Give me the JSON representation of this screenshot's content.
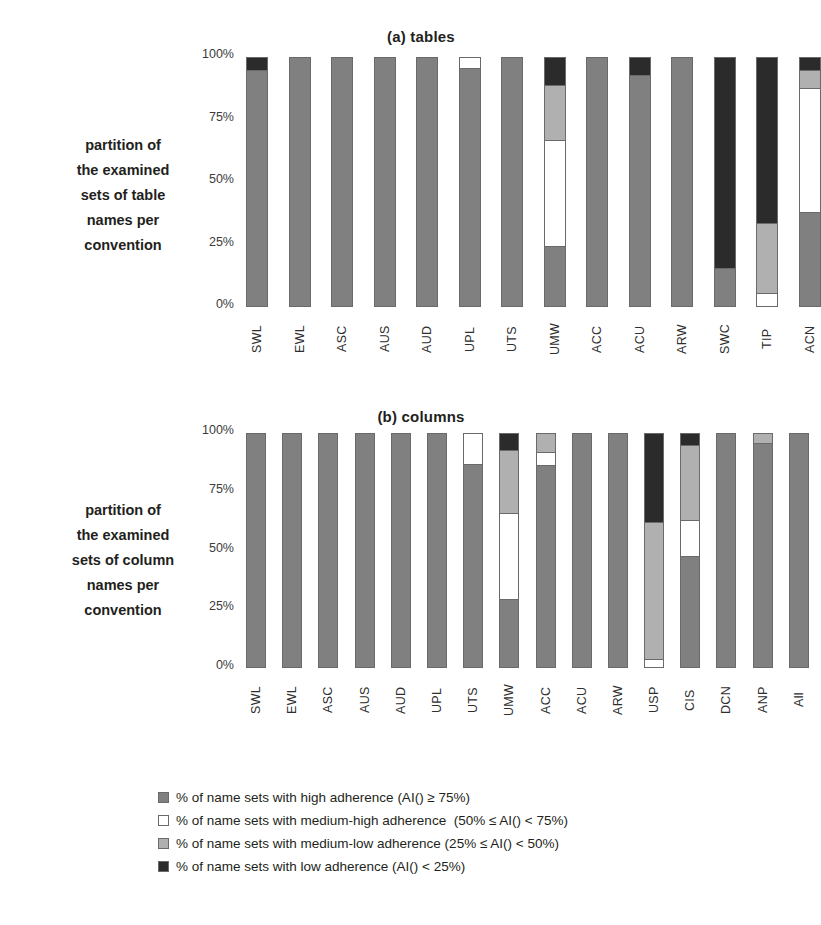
{
  "colors": {
    "high": "#808080",
    "medium_high": "#ffffff",
    "medium_low": "#b0b0b0",
    "low": "#2b2b2b",
    "outline": "#6a6a6a",
    "text": "#231f20"
  },
  "panels": [
    {
      "title": "(a) tables",
      "axis_caption": "partition of\nthe examined\nsets of  table\nnames per\nconvention"
    },
    {
      "title": "(b) columns",
      "axis_caption": "partition of\nthe examined\nsets of  column\nnames per\nconvention"
    }
  ],
  "legend": {
    "items": [
      {
        "swatch": "high",
        "label": "% of name sets with high adherence (AI() ≥ 75%)"
      },
      {
        "swatch": "medium_high",
        "label": "% of name sets with medium-high adherence  (50% ≤ AI() < 75%)"
      },
      {
        "swatch": "medium_low",
        "label": "% of name sets with medium-low adherence (25% ≤ AI() < 50%)"
      },
      {
        "swatch": "low",
        "label": "% of name sets with low adherence (AI() < 25%)"
      }
    ]
  },
  "chart_data": [
    {
      "type": "bar",
      "title": "(a) tables",
      "xlabel": "",
      "ylabel": "partition of the examined sets of  table names per convention",
      "ylim": [
        0,
        100
      ],
      "yticks": [
        "0%",
        "25%",
        "50%",
        "75%",
        "100%"
      ],
      "stacked": true,
      "legend_position": "bottom",
      "grid": false,
      "categories": [
        "SWL",
        "EWL",
        "ASC",
        "AUS",
        "AUD",
        "UPL",
        "UTS",
        "UMW",
        "ACC",
        "ACU",
        "ARW",
        "SWC",
        "TIP",
        "ACN"
      ],
      "series": [
        {
          "name": "high adherence (AI() >= 75%)",
          "values": [
            95,
            100,
            100,
            100,
            100,
            96,
            100,
            24,
            100,
            93,
            100,
            15,
            0,
            38
          ]
        },
        {
          "name": "medium-high adherence (50% <= AI() < 75%)",
          "values": [
            0,
            0,
            0,
            0,
            0,
            4,
            0,
            43,
            0,
            0,
            0,
            0,
            5,
            50
          ]
        },
        {
          "name": "medium-low adherence (25% <= AI() < 50%)",
          "values": [
            0,
            0,
            0,
            0,
            0,
            0,
            0,
            22,
            0,
            0,
            0,
            0,
            28,
            7
          ]
        },
        {
          "name": "low adherence (AI() < 25%)",
          "values": [
            5,
            0,
            0,
            0,
            0,
            0,
            0,
            11,
            0,
            7,
            0,
            85,
            67,
            5
          ]
        }
      ]
    },
    {
      "type": "bar",
      "title": "(b) columns",
      "xlabel": "",
      "ylabel": "partition of the examined sets of  column names per convention",
      "ylim": [
        0,
        100
      ],
      "yticks": [
        "0%",
        "25%",
        "50%",
        "75%",
        "100%"
      ],
      "stacked": true,
      "legend_position": "bottom",
      "grid": false,
      "categories": [
        "SWL",
        "EWL",
        "ASC",
        "AUS",
        "AUD",
        "UPL",
        "UTS",
        "UMW",
        "ACC",
        "ACU",
        "ARW",
        "USP",
        "CIS",
        "DCN",
        "ANP",
        "All"
      ],
      "series": [
        {
          "name": "high adherence (AI() >= 75%)",
          "values": [
            100,
            100,
            100,
            100,
            100,
            100,
            87,
            29,
            87,
            100,
            100,
            0,
            48,
            100,
            96,
            100
          ]
        },
        {
          "name": "medium-high adherence (50% <= AI() < 75%)",
          "values": [
            0,
            0,
            0,
            0,
            0,
            0,
            13,
            37,
            5,
            0,
            0,
            3,
            15,
            0,
            0,
            0
          ]
        },
        {
          "name": "medium-low adherence (25% <= AI() < 50%)",
          "values": [
            0,
            0,
            0,
            0,
            0,
            0,
            0,
            27,
            8,
            0,
            0,
            59,
            32,
            0,
            4,
            0
          ]
        },
        {
          "name": "low adherence (AI() < 25%)",
          "values": [
            0,
            0,
            0,
            0,
            0,
            0,
            0,
            7,
            0,
            0,
            0,
            38,
            5,
            0,
            0,
            0
          ]
        }
      ]
    }
  ]
}
